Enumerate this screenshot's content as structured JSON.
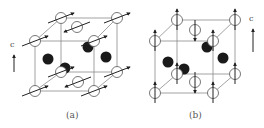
{
  "figure": {
    "colors": {
      "edge": "#8a8a8a",
      "atom_open_stroke": "#555555",
      "atom_open_fill": "#ffffff",
      "atom_dark_fill": "#1a1a1a",
      "arrow": "#222222"
    },
    "panels": [
      {
        "id": "a",
        "caption": "(a)",
        "caption_pos": [
          72,
          116
        ],
        "axis": {
          "label": "c",
          "label_pos": [
            11,
            47
          ],
          "arrow": [
            [
              14,
              72
            ],
            [
              14,
              55
            ]
          ]
        },
        "cube": {
          "front": [
            [
              35,
              41
            ],
            [
              94,
              41
            ],
            [
              94,
              91
            ],
            [
              35,
              91
            ]
          ],
          "back": [
            [
              61,
              18
            ],
            [
              117,
              18
            ],
            [
              117,
              72
            ],
            [
              61,
              72
            ]
          ]
        },
        "open_atoms": [
          {
            "pos": [
              61,
              18
            ],
            "spin": "in-plane-right"
          },
          {
            "pos": [
              117,
              18
            ],
            "spin": "in-plane-right"
          },
          {
            "pos": [
              35,
              41
            ],
            "spin": "in-plane-right"
          },
          {
            "pos": [
              94,
              41
            ],
            "spin": "in-plane-right"
          },
          {
            "pos": [
              77,
              27
            ],
            "spin": "in-plane-left"
          },
          {
            "pos": [
              61,
              72
            ],
            "spin": "in-plane-right"
          },
          {
            "pos": [
              117,
              72
            ],
            "spin": "in-plane-right"
          },
          {
            "pos": [
              35,
              91
            ],
            "spin": "in-plane-right"
          },
          {
            "pos": [
              94,
              91
            ],
            "spin": "in-plane-right"
          },
          {
            "pos": [
              78,
              82
            ],
            "spin": "in-plane-left"
          }
        ],
        "dark_atoms": [
          [
            48,
            59
          ],
          [
            88,
            47
          ],
          [
            106,
            57
          ],
          [
            65,
            68
          ]
        ]
      },
      {
        "id": "b",
        "caption": "(b)",
        "caption_pos": [
          195,
          116
        ],
        "axis": {
          "label": "c",
          "label_pos": [
            250,
            20
          ],
          "arrow": [
            [
              253,
              52
            ],
            [
              253,
              29
            ]
          ]
        },
        "cube": {
          "front": [
            [
              155,
              41
            ],
            [
              213,
              41
            ],
            [
              213,
              93
            ],
            [
              155,
              93
            ]
          ],
          "back": [
            [
              177,
              20
            ],
            [
              235,
              20
            ],
            [
              235,
              74
            ],
            [
              177,
              74
            ]
          ]
        },
        "open_atoms": [
          {
            "pos": [
              177,
              20
            ],
            "spin": "up"
          },
          {
            "pos": [
              235,
              20
            ],
            "spin": "up"
          },
          {
            "pos": [
              155,
              41
            ],
            "spin": "up"
          },
          {
            "pos": [
              213,
              41
            ],
            "spin": "up"
          },
          {
            "pos": [
              195,
              30
            ],
            "spin": "down"
          },
          {
            "pos": [
              177,
              74
            ],
            "spin": "up"
          },
          {
            "pos": [
              235,
              74
            ],
            "spin": "up"
          },
          {
            "pos": [
              155,
              93
            ],
            "spin": "up"
          },
          {
            "pos": [
              213,
              93
            ],
            "spin": "up"
          },
          {
            "pos": [
              195,
              82
            ],
            "spin": "down"
          }
        ],
        "dark_atoms": [
          [
            168,
            62
          ],
          [
            207,
            47
          ],
          [
            223,
            58
          ],
          [
            184,
            69
          ]
        ]
      }
    ]
  }
}
